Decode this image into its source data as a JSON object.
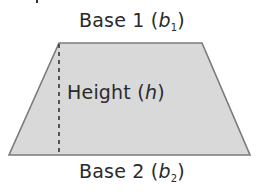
{
  "diagram": {
    "shape": "trapezoid",
    "colors": {
      "fill": "#d9d9d9",
      "stroke": "#7a7a7a",
      "height_line": "#333333",
      "text": "#2a2a2a"
    },
    "vertices": {
      "top_left": [
        59,
        43
      ],
      "top_right": [
        202,
        43
      ],
      "bottom_right": [
        250,
        155
      ],
      "bottom_left": [
        9,
        155
      ]
    },
    "height_line": {
      "x": 59,
      "y1": 43,
      "y2": 155,
      "style": "dashed"
    },
    "labels": {
      "base1": {
        "prefix": "Base 1 (",
        "var": "b",
        "sub": "1",
        "suffix": ")"
      },
      "height": {
        "prefix": "Height (",
        "var": "h",
        "suffix": ")"
      },
      "base2": {
        "prefix": "Base 2 (",
        "var": "b",
        "sub": "2",
        "suffix": ")"
      }
    }
  }
}
